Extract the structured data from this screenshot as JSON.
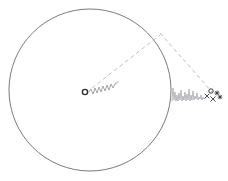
{
  "figure": {
    "title": "",
    "background_color": "#ffffff",
    "width": 228,
    "height": 181
  },
  "colors": {
    "circle_stroke": "#6b6b73",
    "dashed_stroke": "#b9b9c0",
    "signal_stroke": "#9a9aa2",
    "noise_stroke": "#a8a8b0",
    "marker_stroke": "#3a3a40",
    "center_marker_stroke": "#2e2e33"
  },
  "boundary_circle": {
    "name": "coverage-circle",
    "center_x": 90,
    "center_y": 90,
    "radius": 81,
    "stroke_width": 0.9,
    "fill": "none"
  },
  "center_node": {
    "name": "transmitter-node",
    "x": 85,
    "y": 92,
    "marker": "circle",
    "radius": 2.6,
    "stroke_width": 1.4
  },
  "center_signal": {
    "name": "transmitted-waveform",
    "description": "oscillating signal trace emanating from the center node toward the upper right",
    "start_x": 89,
    "start_y": 92,
    "end_x": 118,
    "end_y": 82,
    "points": [
      [
        89,
        92
      ],
      [
        91,
        89
      ],
      [
        93,
        94
      ],
      [
        95,
        88
      ],
      [
        97,
        93
      ],
      [
        99,
        87
      ],
      [
        101,
        92
      ],
      [
        103,
        86
      ],
      [
        105,
        91
      ],
      [
        107,
        85
      ],
      [
        109,
        90
      ],
      [
        111,
        84
      ],
      [
        113,
        88
      ],
      [
        115,
        84
      ],
      [
        118,
        82
      ]
    ]
  },
  "rays": [
    {
      "name": "ray-center-to-boundary",
      "style": "dashed",
      "x1": 92,
      "y1": 88,
      "x2": 160,
      "y2": 35,
      "dash": "4 3",
      "stroke_width": 0.9
    },
    {
      "name": "ray-boundary-to-receiver",
      "style": "dashed",
      "x1": 160,
      "y1": 33,
      "x2": 212,
      "y2": 92,
      "dash": "4 3",
      "stroke_width": 0.9
    }
  ],
  "boundary_vertex": {
    "name": "reflection-point",
    "x": 160,
    "y": 34
  },
  "received_signal": {
    "name": "received-noisy-waveform",
    "description": "noisy received signal trace to the right of the circle, increasing then settling",
    "start_x": 172,
    "start_y": 101,
    "end_x": 206,
    "end_y": 98,
    "points": [
      [
        172,
        101
      ],
      [
        173,
        88
      ],
      [
        174,
        100
      ],
      [
        175,
        92
      ],
      [
        176,
        101
      ],
      [
        177,
        95
      ],
      [
        178,
        101
      ],
      [
        179,
        93
      ],
      [
        180,
        100
      ],
      [
        181,
        90
      ],
      [
        182,
        101
      ],
      [
        183,
        96
      ],
      [
        184,
        100
      ],
      [
        185,
        92
      ],
      [
        186,
        101
      ],
      [
        187,
        94
      ],
      [
        188,
        100
      ],
      [
        189,
        89
      ],
      [
        190,
        101
      ],
      [
        191,
        95
      ],
      [
        192,
        100
      ],
      [
        193,
        91
      ],
      [
        194,
        100
      ],
      [
        195,
        96
      ],
      [
        196,
        99
      ],
      [
        197,
        93
      ],
      [
        198,
        100
      ],
      [
        199,
        97
      ],
      [
        200,
        99
      ],
      [
        201,
        95
      ],
      [
        202,
        100
      ],
      [
        203,
        97
      ],
      [
        204,
        99
      ],
      [
        205,
        98
      ],
      [
        206,
        98
      ]
    ]
  },
  "receiver_cluster": {
    "name": "receiver-marker-cluster",
    "description": "small cluster of cross and star markers marking the receiver location",
    "markers": [
      {
        "name": "receiver-marker-x-1",
        "x": 207,
        "y": 96,
        "glyph": "x",
        "size": 4.0
      },
      {
        "name": "receiver-marker-x-2",
        "x": 213,
        "y": 99,
        "glyph": "x",
        "size": 4.6
      },
      {
        "name": "receiver-marker-star-1",
        "x": 217,
        "y": 93,
        "glyph": "star",
        "size": 4.2
      },
      {
        "name": "receiver-marker-star-2",
        "x": 220,
        "y": 97,
        "glyph": "star",
        "size": 3.8
      },
      {
        "name": "receiver-marker-circle-1",
        "x": 211,
        "y": 91,
        "glyph": "circle",
        "size": 2.2
      }
    ]
  },
  "labels": []
}
